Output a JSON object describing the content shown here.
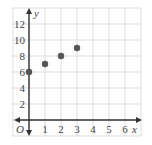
{
  "chart_data": {
    "type": "scatter",
    "title": "",
    "xlabel": "x",
    "ylabel": "y",
    "origin_label": "O",
    "xlim": [
      -1,
      7
    ],
    "ylim": [
      -2,
      14
    ],
    "x_ticks": [
      "1",
      "2",
      "3",
      "4",
      "5",
      "6"
    ],
    "y_ticks": [
      "2",
      "4",
      "6",
      "8",
      "10",
      "12"
    ],
    "grid": true,
    "points": [
      {
        "x": 0,
        "y": 6
      },
      {
        "x": 1,
        "y": 7
      },
      {
        "x": 2,
        "y": 8
      },
      {
        "x": 3,
        "y": 9
      }
    ],
    "colors": {
      "grid": "#d4d4d4",
      "axis": "#333333",
      "point": "#555555",
      "text": "#444444"
    }
  }
}
